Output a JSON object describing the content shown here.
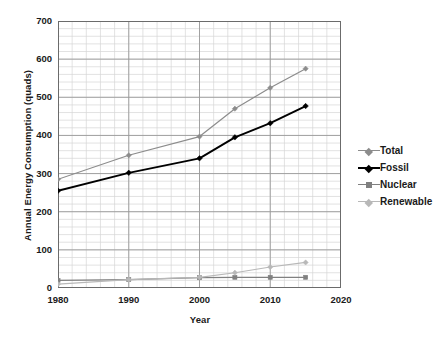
{
  "chart_data": {
    "type": "line",
    "title": "",
    "xlabel": "Year",
    "ylabel": "Annual Energy Consumption (quads)",
    "x": [
      1980,
      1990,
      2000,
      2005,
      2010,
      2015
    ],
    "xlim": [
      1980,
      2020
    ],
    "ylim": [
      0,
      700
    ],
    "xticks": [
      "1980",
      "1990",
      "2000",
      "2010",
      "2020"
    ],
    "xtick_values": [
      1980,
      1990,
      2000,
      2010,
      2020
    ],
    "yticks": [
      "0",
      "100",
      "200",
      "300",
      "400",
      "500",
      "600",
      "700"
    ],
    "ytick_values": [
      0,
      100,
      200,
      300,
      400,
      500,
      600,
      700
    ],
    "grid": true,
    "grid_minor_x_step": 2,
    "grid_minor_y_step": 20,
    "legend_position": "right",
    "series": [
      {
        "name": "Total",
        "color": "#8c8c8c",
        "marker": "diamond",
        "values": [
          285,
          348,
          397,
          470,
          525,
          575
        ]
      },
      {
        "name": "Fossil",
        "color": "#000000",
        "marker": "diamond",
        "values": [
          255,
          302,
          340,
          395,
          432,
          477
        ]
      },
      {
        "name": "Nuclear",
        "color": "#808080",
        "marker": "square",
        "values": [
          20,
          22,
          27,
          28,
          28,
          28
        ]
      },
      {
        "name": "Renewable",
        "color": "#b8b8b8",
        "marker": "diamond",
        "values": [
          10,
          22,
          28,
          40,
          55,
          67
        ]
      }
    ]
  },
  "axes": {
    "y_title": "Annual Energy Consumption (quads)",
    "x_title": "Year"
  },
  "legend": {
    "items": [
      {
        "label": "Total"
      },
      {
        "label": "Fossil"
      },
      {
        "label": "Nuclear"
      },
      {
        "label": "Renewable"
      }
    ]
  },
  "colors": {
    "total": "#8c8c8c",
    "fossil": "#000000",
    "nuclear": "#808080",
    "renewable": "#b8b8b8",
    "grid_major": "#9a9a9a",
    "grid_minor": "#d6d6d6",
    "axis": "#6b6b6b",
    "text": "#1a1a1a"
  }
}
